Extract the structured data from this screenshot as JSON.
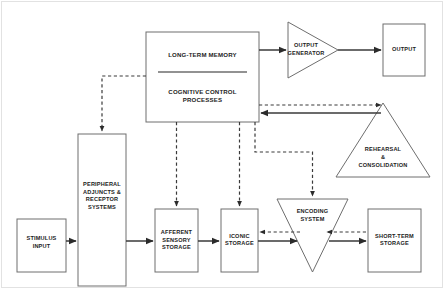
{
  "diagram": {
    "type": "flow-diagram",
    "background_color": "#ffffff",
    "node_stroke_color": "#6e6e6e",
    "link_color": "#3a3a3a",
    "nodes": {
      "stimulus_input": {
        "label_lines": [
          "STIMULUS",
          "INPUT"
        ],
        "shape": "rectangle"
      },
      "peripheral": {
        "label_lines": [
          "PERIPHERAL",
          "ADJUNCTS &",
          "RECEPTOR",
          "SYSTEMS"
        ],
        "shape": "rectangle"
      },
      "afferent": {
        "label_lines": [
          "AFFERENT",
          "SENSORY",
          "STORAGE"
        ],
        "shape": "rectangle"
      },
      "iconic": {
        "label_lines": [
          "ICONIC",
          "STORAGE"
        ],
        "shape": "rectangle"
      },
      "encoding": {
        "label_lines": [
          "ENCODING",
          "SYSTEM"
        ],
        "shape": "triangle-down"
      },
      "short_term": {
        "label_lines": [
          "SHORT-TERM",
          "STORAGE"
        ],
        "shape": "rectangle"
      },
      "long_term": {
        "label_lines": [
          "LONG-TERM MEMORY"
        ],
        "shape": "rectangle-top-half"
      },
      "cognitive": {
        "label_lines": [
          "COGNITIVE CONTROL",
          "PROCESSES"
        ],
        "shape": "rectangle-bottom-half"
      },
      "rehearsal": {
        "label_lines": [
          "REHEARSAL",
          "&",
          "CONSOLIDATION"
        ],
        "shape": "triangle-up"
      },
      "output_generator": {
        "label_lines": [
          "OUTPUT",
          "GENERATOR"
        ],
        "shape": "triangle-right"
      },
      "output": {
        "label_lines": [
          "OUTPUT"
        ],
        "shape": "rectangle"
      }
    },
    "links": [
      {
        "from": "stimulus_input",
        "to": "peripheral",
        "style": "solid",
        "direction": "right"
      },
      {
        "from": "peripheral",
        "to": "afferent",
        "style": "solid",
        "direction": "right"
      },
      {
        "from": "afferent",
        "to": "iconic",
        "style": "solid",
        "direction": "right"
      },
      {
        "from": "iconic",
        "to": "encoding",
        "style": "solid",
        "direction": "right"
      },
      {
        "from": "encoding",
        "to": "short_term",
        "style": "solid",
        "direction": "right"
      },
      {
        "from": "encoding",
        "to": "iconic",
        "style": "dashed",
        "direction": "left"
      },
      {
        "from": "short_term",
        "to": "encoding",
        "style": "dashed",
        "direction": "left"
      },
      {
        "from": "long_term",
        "to": "output_generator",
        "style": "solid",
        "direction": "right"
      },
      {
        "from": "output_generator",
        "to": "output",
        "style": "solid",
        "direction": "right"
      },
      {
        "from": "cognitive",
        "to": "rehearsal",
        "style": "dashed",
        "direction": "right"
      },
      {
        "from": "rehearsal",
        "to": "cognitive",
        "style": "solid",
        "direction": "left"
      },
      {
        "from": "cognitive",
        "to": "peripheral",
        "style": "dashed",
        "direction": "down"
      },
      {
        "from": "cognitive",
        "to": "afferent",
        "style": "dashed",
        "direction": "down"
      },
      {
        "from": "cognitive",
        "to": "iconic",
        "style": "dashed",
        "direction": "down"
      },
      {
        "from": "cognitive",
        "to": "encoding",
        "style": "dashed",
        "direction": "down"
      }
    ]
  }
}
